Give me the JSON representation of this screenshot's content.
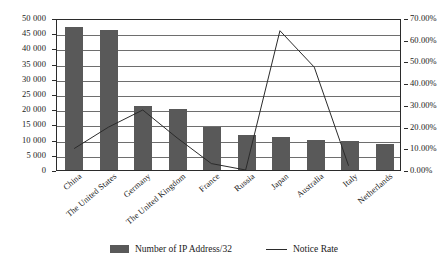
{
  "chart_data": {
    "type": "bar",
    "title": "",
    "subtitle": "",
    "xlabel": "",
    "ylabel": "",
    "categories": [
      "China",
      "The United States",
      "Germany",
      "The United Kingdom",
      "France",
      "Russia",
      "Japan",
      "Australia",
      "Italy",
      "Netherlands"
    ],
    "series": [
      {
        "name": "Number of IP Address/32",
        "type": "bar",
        "axis": "left",
        "color": "#595959",
        "values": [
          47000,
          46000,
          21000,
          20000,
          14000,
          11500,
          11000,
          10000,
          9500,
          8500
        ]
      },
      {
        "name": "Notice Rate",
        "type": "line",
        "axis": "right",
        "color": "#2b2b2b",
        "values": [
          0.1,
          0.2,
          0.28,
          0.15,
          0.03,
          0.0,
          0.65,
          0.48,
          0.02,
          null
        ]
      }
    ],
    "ylim": [
      0,
      50000
    ],
    "ylim_right": [
      0,
      0.7
    ],
    "grid": true,
    "legend_position": "bottom",
    "y_left_ticks": [
      "0",
      "5 000",
      "10 000",
      "15 000",
      "20 000",
      "25 000",
      "30 000",
      "35 000",
      "40 000",
      "45 000",
      "50 000"
    ],
    "y_right_ticks": [
      "0.00%",
      "10.00%",
      "20.00%",
      "30.00%",
      "40.00%",
      "50.00%",
      "60.00%",
      "70.00%"
    ]
  },
  "legend": {
    "bar_label": "Number of IP Address/32",
    "line_label": "Notice Rate"
  }
}
